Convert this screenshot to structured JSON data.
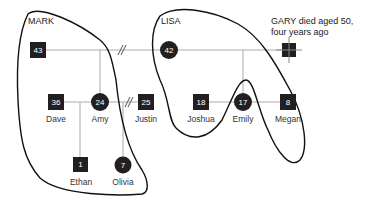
{
  "diagram": {
    "type": "genogram",
    "households": [
      {
        "label": "MARK"
      },
      {
        "label": "LISA"
      }
    ],
    "annotation": {
      "line1": "GARY died aged 50,",
      "line2": "four years ago"
    },
    "people": {
      "mark": {
        "age": "43",
        "name": "",
        "sex": "male"
      },
      "lisa": {
        "age": "42",
        "name": "",
        "sex": "female"
      },
      "gary": {
        "age": "",
        "name": "",
        "sex": "male",
        "deceased": true
      },
      "dave": {
        "age": "36",
        "name": "Dave",
        "sex": "male"
      },
      "amy": {
        "age": "24",
        "name": "Amy",
        "sex": "female"
      },
      "justin": {
        "age": "25",
        "name": "Justin",
        "sex": "male"
      },
      "ethan": {
        "age": "1",
        "name": "Ethan",
        "sex": "male"
      },
      "olivia": {
        "age": "7",
        "name": "Olivia",
        "sex": "female"
      },
      "joshua": {
        "age": "18",
        "name": "Joshua",
        "sex": "male"
      },
      "emily": {
        "age": "17",
        "name": "Emily",
        "sex": "female"
      },
      "megan": {
        "age": "8",
        "name": "Megan",
        "sex": "male"
      }
    },
    "relationships": [
      {
        "from": "Mark",
        "to": "Lisa",
        "status": "divorced"
      },
      {
        "from": "Lisa",
        "to": "Gary",
        "status": "married"
      },
      {
        "from": "Amy",
        "to": "Justin",
        "status": "divorced"
      },
      {
        "from": "Dave",
        "to": "Amy",
        "status": "partners"
      }
    ]
  }
}
